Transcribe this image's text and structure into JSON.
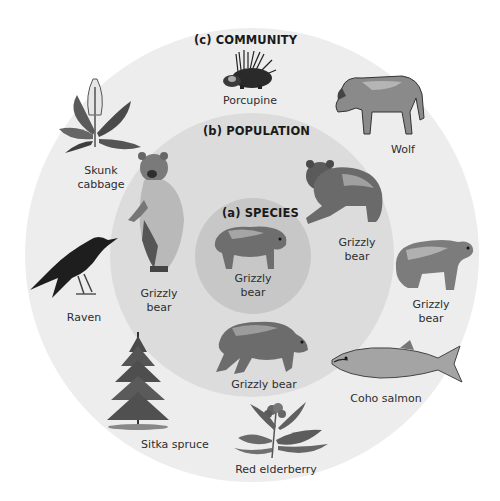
{
  "levels": {
    "community": {
      "heading": "(c) COMMUNITY"
    },
    "population": {
      "heading": "(b) POPULATION"
    },
    "species": {
      "heading": "(a) SPECIES"
    }
  },
  "species_members": [
    {
      "label_line1": "Grizzly",
      "label_line2": "bear"
    }
  ],
  "population_members": [
    {
      "id": "standing",
      "label_line1": "Grizzly",
      "label_line2": "bear"
    },
    {
      "id": "upper-right",
      "label_line1": "Grizzly",
      "label_line2": "bear"
    },
    {
      "id": "bottom",
      "label_line1": "Grizzly bear"
    }
  ],
  "community_members": [
    {
      "id": "porcupine",
      "label_line1": "Porcupine"
    },
    {
      "id": "wolf",
      "label_line1": "Wolf"
    },
    {
      "id": "skunk-cabbage",
      "label_line1": "Skunk",
      "label_line2": "cabbage"
    },
    {
      "id": "raven",
      "label_line1": "Raven"
    },
    {
      "id": "grizzly-right",
      "label_line1": "Grizzly",
      "label_line2": "bear"
    },
    {
      "id": "coho-salmon",
      "label_line1": "Coho salmon"
    },
    {
      "id": "sitka-spruce",
      "label_line1": "Sitka spruce"
    },
    {
      "id": "red-elderberry",
      "label_line1": "Red elderberry"
    }
  ]
}
